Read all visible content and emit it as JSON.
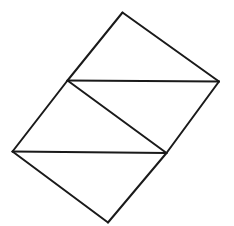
{
  "diagram": {
    "stroke_color": "#1a1a1a",
    "background": "#ffffff",
    "vertices": {
      "top": [
        122.5,
        12.5
      ],
      "right": [
        219,
        81.5
      ],
      "upper_left": [
        67.5,
        80.5
      ],
      "left": [
        12.5,
        151.5
      ],
      "lower_right": [
        166.5,
        153
      ],
      "bottom": [
        108,
        222.5
      ]
    },
    "edges": [
      {
        "name": "edge-top-right",
        "from": "top",
        "to": "right"
      },
      {
        "name": "edge-top-upper-left",
        "from": "top",
        "to": "upper_left"
      },
      {
        "name": "edge-upper-left-right",
        "from": "upper_left",
        "to": "right"
      },
      {
        "name": "edge-right-lower-right",
        "from": "right",
        "to": "lower_right"
      },
      {
        "name": "edge-upper-left-left",
        "from": "upper_left",
        "to": "left"
      },
      {
        "name": "edge-upper-left-lower-right",
        "from": "upper_left",
        "to": "lower_right"
      },
      {
        "name": "edge-left-lower-right",
        "from": "left",
        "to": "lower_right"
      },
      {
        "name": "edge-left-bottom",
        "from": "left",
        "to": "bottom"
      },
      {
        "name": "edge-lower-right-bottom",
        "from": "lower_right",
        "to": "bottom"
      }
    ]
  }
}
